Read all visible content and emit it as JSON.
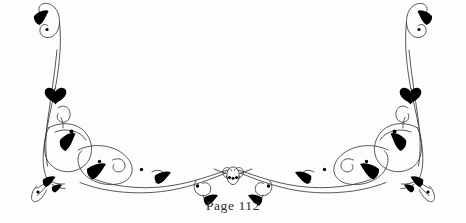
{
  "document": {
    "type": "decorative-page-ornament",
    "background_color": "#fdfdfd",
    "ink_color": "#3a3a3a",
    "accent_color": "#000000",
    "text_color": "#2b2b2b"
  },
  "ornament": {
    "name": "symmetric-floral-tailpiece",
    "description": "Mirrored calligraphic scrollwork flourish with leaf accents and dotted terminals",
    "symmetry": "horizontal-mirror",
    "center_motif": "three-dot-rosette",
    "stroke_color": "#3a3a3a",
    "leaf_color": "#000000"
  },
  "footer": {
    "page_label": "Page 112",
    "page_number": 112
  }
}
